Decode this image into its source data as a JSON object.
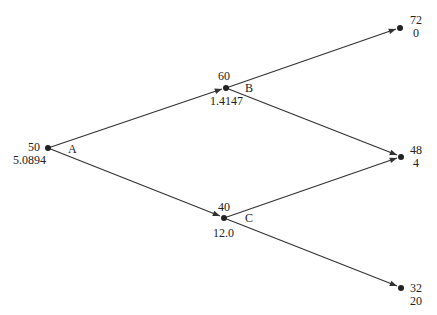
{
  "diagram": {
    "type": "binomial-tree",
    "nodes": [
      {
        "id": "A",
        "label": "A",
        "price": "50",
        "value": "5.0894"
      },
      {
        "id": "B",
        "label": "B",
        "price": "60",
        "value": "1.4147"
      },
      {
        "id": "C",
        "label": "C",
        "price": "40",
        "value": "12.0"
      },
      {
        "id": "UU",
        "price": "72",
        "value": "0"
      },
      {
        "id": "UD",
        "price": "48",
        "value": "4"
      },
      {
        "id": "DD",
        "price": "32",
        "value": "20"
      }
    ],
    "edges": [
      {
        "from": "A",
        "to": "B"
      },
      {
        "from": "A",
        "to": "C"
      },
      {
        "from": "B",
        "to": "UU"
      },
      {
        "from": "B",
        "to": "UD"
      },
      {
        "from": "C",
        "to": "UD"
      },
      {
        "from": "C",
        "to": "DD"
      }
    ],
    "colors": {
      "line": "#333333",
      "node": "#222222"
    }
  }
}
